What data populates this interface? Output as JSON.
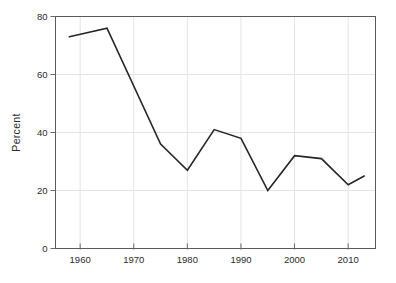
{
  "chart_data": {
    "type": "line",
    "title": "",
    "xlabel": "",
    "ylabel": "Percent",
    "x": [
      1958,
      1965,
      1975,
      1980,
      1985,
      1990,
      1995,
      2000,
      2005,
      2010,
      2013
    ],
    "values": [
      73,
      76,
      36,
      27,
      41,
      38,
      20,
      32,
      31,
      22,
      25
    ],
    "series": [
      {
        "name": "Percent",
        "values": [
          73,
          76,
          36,
          27,
          41,
          38,
          20,
          32,
          31,
          22,
          25
        ]
      }
    ],
    "xticks": [
      1960,
      1970,
      1980,
      1990,
      2000,
      2010
    ],
    "yticks": [
      0,
      20,
      40,
      60,
      80
    ],
    "xlim": [
      1955.4,
      2015.1
    ],
    "ylim": [
      0,
      80
    ],
    "grid": true,
    "legend": "none",
    "colors": {
      "line": "#262626",
      "grid": "#e4e4e4",
      "frame": "#5a5a5a",
      "tick": "#6a6a6a",
      "label": "#2b2b2b",
      "background": "#ffffff"
    }
  }
}
